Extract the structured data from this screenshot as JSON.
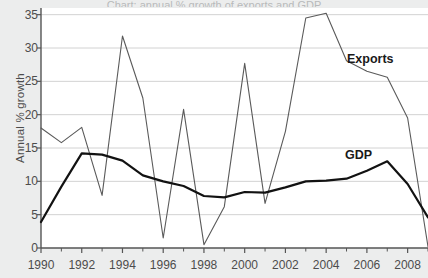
{
  "figure": {
    "cut_title": "Chart: annual % growth of exports and GDP",
    "background_color": "#eceded",
    "plot_background_color": "#ffffff",
    "axis_color": "#555555",
    "grid_color": "#d2d2d2"
  },
  "labels": {
    "exports": "Exports",
    "gdp": "GDP"
  },
  "chart_data": {
    "type": "line",
    "title": "",
    "xlabel": "",
    "ylabel": "Annual % growth",
    "x": [
      1990,
      1991,
      1992,
      1993,
      1994,
      1995,
      1996,
      1997,
      1998,
      1999,
      2000,
      2001,
      2002,
      2003,
      2004,
      2005,
      2006,
      2007,
      2008,
      2009
    ],
    "xlim": [
      1990,
      2009
    ],
    "ylim": [
      0,
      36
    ],
    "yticks": [
      0,
      5,
      10,
      15,
      20,
      25,
      30,
      35
    ],
    "ytick_labels": [
      "0",
      "5",
      "10",
      "15",
      "20",
      "25",
      "30",
      "35"
    ],
    "xticks": [
      1990,
      1992,
      1994,
      1996,
      1998,
      2000,
      2002,
      2004,
      2006,
      2008
    ],
    "xtick_labels": [
      "1990",
      "1992",
      "1994",
      "1996",
      "1998",
      "2000",
      "2002",
      "2004",
      "2006",
      "2008"
    ],
    "xminor_ticks": [
      1991,
      1993,
      1995,
      1997,
      1999,
      2001,
      2003,
      2005,
      2007,
      2009
    ],
    "grid": "horizontal",
    "legend_position": "inline-annotation",
    "series": [
      {
        "name": "Exports",
        "color": "#5a5a5a",
        "line_width": 1.1,
        "values": [
          18.0,
          15.8,
          18.1,
          7.9,
          31.8,
          22.5,
          1.5,
          20.8,
          0.5,
          6.2,
          27.7,
          6.7,
          17.5,
          34.5,
          35.2,
          28.1,
          26.5,
          25.6,
          19.5,
          0.2
        ]
      },
      {
        "name": "GDP",
        "color": "#121212",
        "line_width": 2.2,
        "values": [
          3.9,
          9.2,
          14.2,
          14.0,
          13.1,
          10.9,
          10.0,
          9.3,
          7.8,
          7.6,
          8.4,
          8.3,
          9.1,
          10.0,
          10.1,
          10.4,
          11.6,
          13.0,
          9.6,
          4.6
        ]
      }
    ]
  }
}
